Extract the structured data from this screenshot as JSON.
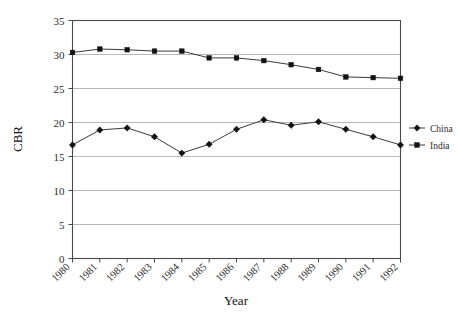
{
  "chart_data": {
    "type": "line",
    "title": "",
    "xlabel": "Year",
    "ylabel": "CBR",
    "x": [
      1980,
      1981,
      1982,
      1983,
      1984,
      1985,
      1986,
      1987,
      1988,
      1989,
      1990,
      1991,
      1992
    ],
    "categories": [
      "1980",
      "1981",
      "1982",
      "1983",
      "1984",
      "1985",
      "1986",
      "1987",
      "1988",
      "1989",
      "1990",
      "1991",
      "1992"
    ],
    "series": [
      {
        "name": "China",
        "marker": "diamond",
        "color": "#121212",
        "values": [
          16.7,
          18.9,
          19.2,
          17.9,
          15.5,
          16.8,
          19.0,
          20.4,
          19.6,
          20.1,
          19.0,
          17.9,
          16.7
        ]
      },
      {
        "name": "India",
        "marker": "square",
        "color": "#121212",
        "values": [
          30.3,
          30.8,
          30.7,
          30.5,
          30.5,
          29.5,
          29.5,
          29.1,
          28.5,
          27.8,
          26.7,
          26.6,
          26.5
        ]
      }
    ],
    "ylim": [
      0,
      35
    ],
    "yticks": [
      0,
      5,
      10,
      15,
      20,
      25,
      30,
      35
    ],
    "ytick_labels": [
      "0",
      "5",
      "10",
      "15",
      "20",
      "25",
      "30",
      "35"
    ],
    "xlim": [
      1980,
      1992
    ],
    "grid": true,
    "grid_axis": "y",
    "legend_position": "right",
    "legend_entries": [
      "China",
      "India"
    ]
  },
  "axes": {
    "y_title": "CBR",
    "x_title": "Year"
  },
  "legend": {
    "items": [
      {
        "label": "China"
      },
      {
        "label": "India"
      }
    ]
  }
}
